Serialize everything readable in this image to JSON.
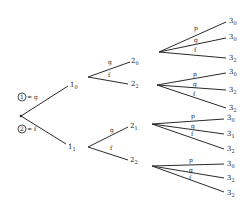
{
  "legend": {
    "item1": {
      "circle": "1",
      "text": "= g"
    },
    "item2": {
      "circle": "2",
      "text": "= f"
    }
  },
  "level1": [
    {
      "base": "1",
      "sub": "0",
      "edge_label": "g"
    },
    {
      "base": "1",
      "sub": "1",
      "edge_label": "f"
    }
  ],
  "level2": [
    {
      "base": "2",
      "sub": "0",
      "edge_label": "g"
    },
    {
      "base": "2",
      "sub": "2",
      "edge_label": "f"
    },
    {
      "base": "2",
      "sub": "1",
      "edge_label": "g"
    },
    {
      "base": "2",
      "sub": "2",
      "edge_label": "f"
    }
  ],
  "level3": [
    {
      "base": "3",
      "sub": "0",
      "edge_label": "p"
    },
    {
      "base": "3",
      "sub": "0",
      "edge_label": "g"
    },
    {
      "base": "3",
      "sub": "2",
      "edge_label": "f"
    },
    {
      "base": "3",
      "sub": "0",
      "edge_label": "p"
    },
    {
      "base": "3",
      "sub": "2",
      "edge_label": "g"
    },
    {
      "base": "3",
      "sub": "2",
      "edge_label": "f"
    },
    {
      "base": "3",
      "sub": "0",
      "edge_label": "p"
    },
    {
      "base": "3",
      "sub": "1",
      "edge_label": "g"
    },
    {
      "base": "3",
      "sub": "2",
      "edge_label": "f"
    },
    {
      "base": "3",
      "sub": "0",
      "edge_label": "p"
    },
    {
      "base": "3",
      "sub": "2",
      "edge_label": "g"
    },
    {
      "base": "3",
      "sub": "2",
      "edge_label": "f"
    }
  ]
}
